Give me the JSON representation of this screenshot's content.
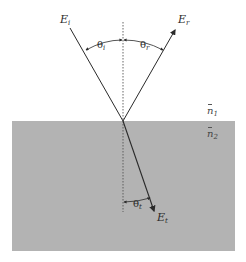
{
  "diagram": {
    "type": "reflection-refraction-at-interface",
    "colors": {
      "background": "#ffffff",
      "medium2": "#b3b3b3",
      "ray": "#2a2a2a",
      "normal": "#555555"
    },
    "labels": {
      "incident_field": {
        "base": "E",
        "sub": "i"
      },
      "reflected_field": {
        "base": "E",
        "sub": "r"
      },
      "transmitted_field": {
        "base": "E",
        "sub": "t"
      },
      "incident_angle": {
        "base": "θ",
        "sub": "i"
      },
      "reflected_angle": {
        "base": "θ",
        "sub": "r"
      },
      "transmitted_angle": {
        "base": "θ",
        "sub": "t"
      },
      "medium1": {
        "base": "n",
        "sub": "1"
      },
      "medium2": {
        "base": "n",
        "sub": "2"
      }
    }
  }
}
